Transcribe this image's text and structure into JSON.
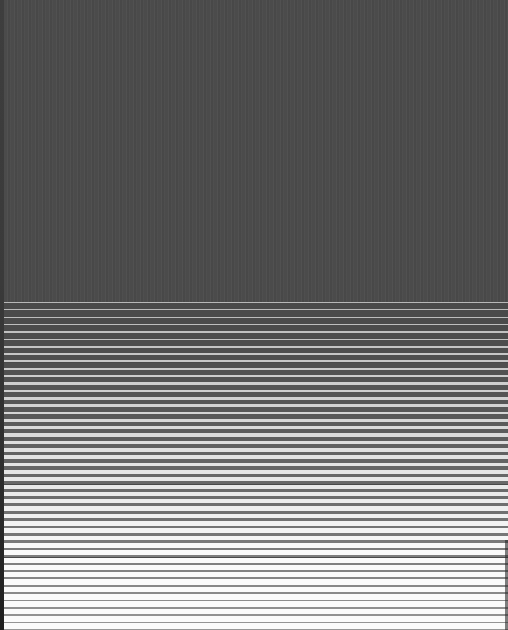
{
  "pattern": {
    "description": "Dark gray field above a field of horizontal stripes whose light bands thicken toward the bottom",
    "colors": {
      "dark": "#4a4a4a",
      "light_top": "#b8b8b8",
      "light_bottom": "#fafafa",
      "edge": "#2a2a2a"
    },
    "top_field_height": 302,
    "stripe_start_y": 302,
    "stripe_count": 45,
    "stripe_period": 7.3,
    "light_band_min": 1,
    "light_band_max": 6
  }
}
